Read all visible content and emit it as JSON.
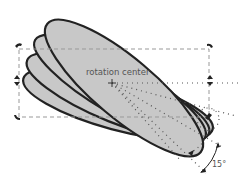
{
  "diagram": {
    "labels": {
      "rotation_center": "rotation center",
      "angle": "15°"
    },
    "shapes": {
      "count": 4,
      "type": "ellipse",
      "fill": "#c8c8c8",
      "stroke": "#222222",
      "rotation_step_deg": 15
    },
    "bounding_box": {
      "style": "dashed",
      "color": "#888888"
    },
    "handles": {
      "color": "#222222",
      "items": [
        "top-left-rotate",
        "top-right-rotate",
        "left-skew",
        "right-skew",
        "bottom-left-rotate",
        "bottom-right-rotate"
      ]
    },
    "guides": {
      "style": "dotted",
      "color": "#555555"
    }
  }
}
